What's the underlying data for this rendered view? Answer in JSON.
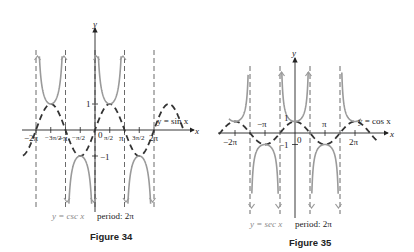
{
  "figures": [
    {
      "id": "figure-34",
      "title": "Figure 34",
      "function_label": "y = csc x",
      "period_label": "period: 2π",
      "dashed_curve_label": "y = sin x",
      "axis_labels": {
        "x": "x",
        "y": "y"
      },
      "x_ticks": [
        "−2π",
        "−3π/2",
        "−π",
        "−π/2",
        "0",
        "π/2",
        "π",
        "3π/2",
        "2π"
      ],
      "y_ticks": [
        "1",
        "−1"
      ]
    },
    {
      "id": "figure-35",
      "title": "Figure 35",
      "function_label": "y = sec x",
      "period_label": "period: 2π",
      "dashed_curve_label": "y = cos x",
      "axis_labels": {
        "x": "x",
        "y": "y"
      },
      "x_ticks": [
        "−2π",
        "−π",
        "0",
        "π",
        "2π"
      ],
      "y_ticks": [
        "1",
        "−1"
      ]
    }
  ],
  "colors": {
    "curve": "#9a9a9a",
    "dashed": "#333333",
    "axis": "#222222",
    "caption_function": "#8a8a8a"
  },
  "chart_data": [
    {
      "type": "line",
      "title": "Figure 34",
      "series": [
        {
          "name": "y = csc x",
          "style": "solid gray, vertical asymptotes at x = nπ"
        },
        {
          "name": "y = sin x",
          "style": "dashed dark"
        }
      ],
      "xlabel": "x",
      "ylabel": "y",
      "xlim": [
        -6.6,
        6.6
      ],
      "x_tick_labels": [
        "−2π",
        "−3π/2",
        "−π",
        "−π/2",
        "0",
        "π/2",
        "π",
        "3π/2",
        "2π"
      ],
      "y_tick_labels": [
        "1",
        "−1"
      ],
      "annotations": [
        "y = sin x",
        "y = csc x",
        "period: 2π"
      ],
      "asymptotes": [
        "−2π",
        "−π",
        "0",
        "π",
        "2π"
      ]
    },
    {
      "type": "line",
      "title": "Figure 35",
      "series": [
        {
          "name": "y = sec x",
          "style": "solid gray, vertical asymptotes at x = π/2 + nπ"
        },
        {
          "name": "y = cos x",
          "style": "dashed dark"
        }
      ],
      "xlabel": "x",
      "ylabel": "y",
      "xlim": [
        -7.0,
        7.0
      ],
      "x_tick_labels": [
        "−2π",
        "−π",
        "0",
        "π",
        "2π"
      ],
      "y_tick_labels": [
        "1",
        "−1"
      ],
      "annotations": [
        "y = cos x",
        "y = sec x",
        "period: 2π"
      ],
      "asymptotes": [
        "−3π/2",
        "−π/2",
        "π/2",
        "3π/2"
      ]
    }
  ]
}
